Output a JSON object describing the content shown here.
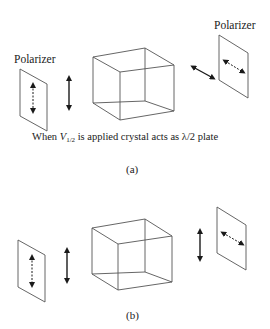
{
  "figure": {
    "panel_a": {
      "left_polarizer_label": "Polarizer",
      "right_polarizer_label": "Polarizer",
      "caption_prefix": "When ",
      "caption_voltage_symbol": "V",
      "caption_voltage_subscript": "1/2",
      "caption_suffix": " is applied crystal acts as λ/2 plate",
      "panel_label": "(a)",
      "input_polarization": "vertical",
      "output_polarization": "diagonal (rotated 90°)",
      "right_polarizer_axis": "diagonal"
    },
    "panel_b": {
      "panel_label": "(b)",
      "input_polarization": "vertical",
      "output_polarization": "vertical",
      "right_polarizer_axis": "diagonal"
    },
    "colors": {
      "line": "#555555",
      "arrow": "#1a1a1a",
      "background": "#ffffff"
    }
  }
}
